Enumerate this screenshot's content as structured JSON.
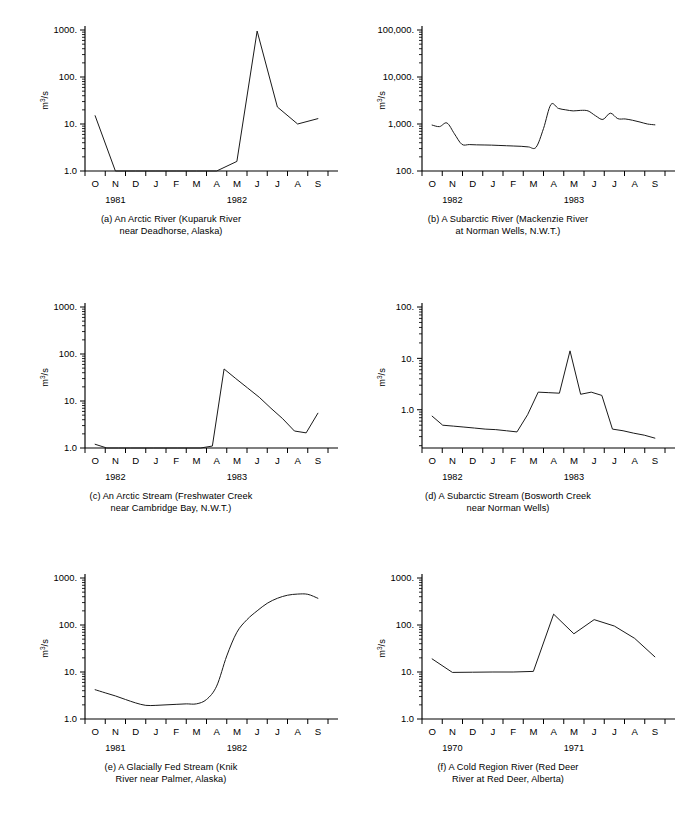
{
  "figure": {
    "units_label": "m3/s",
    "units_label_parts": {
      "base": "m",
      "sup": "3",
      "tail": "/s"
    },
    "months": [
      "O",
      "N",
      "D",
      "J",
      "F",
      "M",
      "A",
      "M",
      "J",
      "J",
      "A",
      "S"
    ]
  },
  "panels": [
    {
      "id": "a",
      "caption_lines": [
        "(a) An Arctic River (Kuparuk River",
        "near Deadhorse, Alaska)"
      ],
      "years": [
        "1981",
        "1982"
      ],
      "ylabel": "m3/s",
      "yticks": [
        "1.0",
        "10.",
        "100.",
        "1000."
      ],
      "chart_data": {
        "type": "line",
        "title": "(a) An Arctic River (Kuparuk River near Deadhorse, Alaska)",
        "xlabel": "",
        "ylabel": "m3/s",
        "yscale": "log",
        "ylim": [
          1.0,
          1000.0
        ],
        "ytick_values": [
          1,
          10,
          100,
          1000
        ],
        "ytick_labels": [
          "1.0",
          "10.",
          "100.",
          "1000."
        ],
        "grid": false,
        "legend": "none",
        "x": [
          "O",
          "N",
          "D",
          "J",
          "F",
          "M",
          "A",
          "M",
          "J",
          "J",
          "A",
          "S"
        ],
        "values": [
          15,
          1.0,
          1.0,
          1.0,
          1.0,
          1.0,
          1.0,
          1.6,
          950,
          23,
          10,
          13
        ]
      }
    },
    {
      "id": "b",
      "caption_lines": [
        "(b) A Subarctic River (Mackenzie River",
        "at Norman Wells, N.W.T.)"
      ],
      "years": [
        "1982",
        "1983"
      ],
      "ylabel": "m3/s",
      "yticks": [
        "100.",
        "1,000.",
        "10,000.",
        "100,000."
      ],
      "chart_data": {
        "type": "line",
        "title": "(b) A Subarctic River (Mackenzie River at Norman Wells, N.W.T.)",
        "xlabel": "",
        "ylabel": "m3/s",
        "yscale": "log",
        "ylim": [
          100.0,
          100000.0
        ],
        "ytick_values": [
          100,
          1000,
          10000,
          100000
        ],
        "ytick_labels": [
          "100.",
          "1,000.",
          "10,000.",
          "100,000."
        ],
        "grid": false,
        "legend": "none",
        "x": [
          "O",
          "N",
          "D",
          "J",
          "F",
          "M",
          "A",
          "M",
          "J",
          "J",
          "A",
          "S"
        ],
        "values": [
          950,
          1050,
          370,
          355,
          345,
          335,
          320,
          2600,
          1900,
          1450,
          1250,
          960
        ],
        "dense_values": [
          950,
          880,
          1050,
          620,
          370,
          365,
          360,
          358,
          355,
          350,
          345,
          340,
          335,
          325,
          320,
          800,
          2600,
          2150,
          2000,
          1900,
          1950,
          1900,
          1500,
          1250,
          1700,
          1300,
          1280,
          1200,
          1100,
          1000,
          960
        ]
      }
    },
    {
      "id": "c",
      "caption_lines": [
        "(c) An Arctic Stream (Freshwater Creek",
        "near Cambridge Bay, N.W.T.)"
      ],
      "years": [
        "1982",
        "1983"
      ],
      "ylabel": "m3/s",
      "yticks": [
        "1.0",
        "10.",
        "100.",
        "1000."
      ],
      "chart_data": {
        "type": "line",
        "title": "(c) An Arctic Stream (Freshwater Creek near Cambridge Bay, N.W.T.)",
        "xlabel": "",
        "ylabel": "m3/s",
        "yscale": "log",
        "ylim": [
          1.0,
          1000.0
        ],
        "ytick_values": [
          1,
          10,
          100,
          1000
        ],
        "ytick_labels": [
          "1.0",
          "10.",
          "100.",
          "1000."
        ],
        "grid": false,
        "legend": "none",
        "x": [
          "O",
          "N",
          "D",
          "J",
          "F",
          "M",
          "A",
          "M",
          "J",
          "J",
          "A",
          "S"
        ],
        "values": [
          1.2,
          1.0,
          1.0,
          1.0,
          1.0,
          1.0,
          1.0,
          1.0,
          48,
          20,
          7.5,
          5.5
        ],
        "dense_values": [
          1.2,
          1.0,
          1.0,
          1.0,
          1.0,
          1.0,
          1.0,
          1.0,
          1.0,
          1.0,
          1.1,
          48,
          30,
          19,
          12,
          7.0,
          4.2,
          2.3,
          2.1,
          5.5
        ]
      }
    },
    {
      "id": "d",
      "caption_lines": [
        "(d) A Subarctic Stream (Bosworth Creek",
        "near Norman Wells)"
      ],
      "years": [
        "1982",
        "1983"
      ],
      "ylabel": "m3/s",
      "yticks": [
        "1.0",
        "10.",
        "100."
      ],
      "chart_data": {
        "type": "line",
        "title": "(d) A Subarctic Stream (Bosworth Creek near Norman Wells)",
        "xlabel": "",
        "ylabel": "m3/s",
        "yscale": "log",
        "ylim": [
          0.18,
          100.0
        ],
        "ytick_values": [
          1,
          10,
          100
        ],
        "ytick_labels": [
          "1.0",
          "10.",
          "100."
        ],
        "grid": false,
        "legend": "none",
        "x": [
          "O",
          "N",
          "D",
          "J",
          "F",
          "M",
          "A",
          "M",
          "J",
          "J",
          "A",
          "S"
        ],
        "values": [
          0.75,
          0.5,
          0.47,
          0.44,
          0.42,
          0.4,
          0.37,
          2.2,
          14,
          0.42,
          0.33,
          0.28
        ],
        "dense_values": [
          0.75,
          0.5,
          0.48,
          0.46,
          0.44,
          0.42,
          0.41,
          0.39,
          0.37,
          0.8,
          2.2,
          2.15,
          2.1,
          14,
          2.0,
          2.2,
          1.9,
          0.42,
          0.39,
          0.35,
          0.32,
          0.28
        ]
      }
    },
    {
      "id": "e",
      "caption_lines": [
        "(e) A Glacially Fed Stream (Knik",
        "River near Palmer, Alaska)"
      ],
      "years": [
        "1981",
        "1982"
      ],
      "ylabel": "m3/s",
      "yticks": [
        "1.0",
        "10.",
        "100.",
        "1000."
      ],
      "chart_data": {
        "type": "line",
        "title": "(e) A Glacially Fed Stream (Knik River near Palmer, Alaska)",
        "xlabel": "",
        "ylabel": "m3/s",
        "yscale": "log",
        "ylim": [
          1.0,
          1000.0
        ],
        "ytick_values": [
          1,
          10,
          100,
          1000
        ],
        "ytick_labels": [
          "1.0",
          "10.",
          "100.",
          "1000."
        ],
        "grid": false,
        "legend": "none",
        "x": [
          "O",
          "N",
          "D",
          "J",
          "F",
          "M",
          "A",
          "M",
          "J",
          "J",
          "A",
          "S"
        ],
        "values": [
          4.2,
          3.2,
          2.5,
          1.95,
          2.0,
          2.1,
          3.0,
          45,
          180,
          330,
          440,
          370
        ],
        "dense_values": [
          4.2,
          3.6,
          3.1,
          2.6,
          2.2,
          1.95,
          1.95,
          2.0,
          2.05,
          2.1,
          2.1,
          2.6,
          5.0,
          22,
          70,
          130,
          200,
          290,
          370,
          430,
          455,
          450,
          370
        ]
      }
    },
    {
      "id": "f",
      "caption_lines": [
        "(f) A Cold Region River (Red Deer",
        "River at Red Deer, Alberta)"
      ],
      "years": [
        "1970",
        "1971"
      ],
      "ylabel": "m3/s",
      "yticks": [
        "1.0",
        "10.",
        "100.",
        "1000."
      ],
      "chart_data": {
        "type": "line",
        "title": "(f) A Cold Region River (Red Deer River at Red Deer, Alberta)",
        "xlabel": "",
        "ylabel": "m3/s",
        "yscale": "log",
        "ylim": [
          1.0,
          1000.0
        ],
        "ytick_values": [
          1,
          10,
          100,
          1000
        ],
        "ytick_labels": [
          "1.0",
          "10.",
          "100.",
          "1000."
        ],
        "grid": false,
        "legend": "none",
        "x": [
          "O",
          "N",
          "D",
          "J",
          "F",
          "M",
          "A",
          "M",
          "J",
          "J",
          "A",
          "S"
        ],
        "values": [
          19,
          9.8,
          9.9,
          10.0,
          10.0,
          10.3,
          170,
          65,
          130,
          95,
          52,
          21
        ],
        "dense_values": [
          19,
          9.8,
          9.9,
          10.0,
          10.0,
          10.3,
          170,
          65,
          130,
          95,
          52,
          21
        ]
      }
    }
  ]
}
